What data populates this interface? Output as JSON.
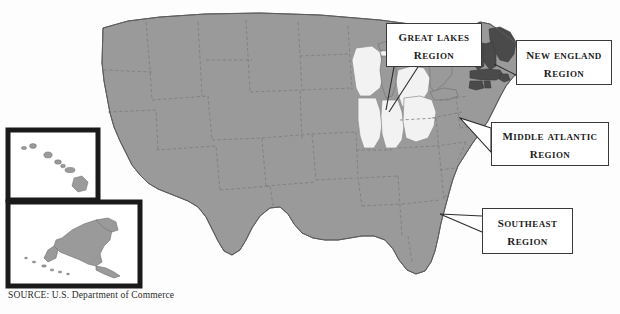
{
  "figure": {
    "source_note": "SOURCE: U.S. Department of Commerce",
    "base_map_name": "united-states-map"
  },
  "colors": {
    "base_state_fill": "#9a9a9a",
    "highlight_light_fill": "#f2f2f2",
    "highlight_dark_fill": "#4a4a4a",
    "state_border": "#6f6f6f",
    "outline": "#5c5c5c",
    "callout_border": "#3a3a3a",
    "callout_fill": "#ffffff",
    "text": "#1c1c1c",
    "inset_border": "#1a1a1a",
    "background": "#fdfdfd"
  },
  "callouts": [
    {
      "id": "great-lakes",
      "line1": "Great Lakes",
      "line2": "Region",
      "shading": "light",
      "states": [
        "Wisconsin",
        "Michigan",
        "Illinois",
        "Indiana",
        "Ohio"
      ]
    },
    {
      "id": "new-england",
      "line1": "New England",
      "line2": "Region",
      "shading": "dark",
      "states": [
        "Maine",
        "New Hampshire",
        "Vermont",
        "Massachusetts",
        "Rhode Island",
        "Connecticut"
      ]
    },
    {
      "id": "middle-atlantic",
      "line1": "Middle Atlantic",
      "line2": "Region",
      "shading": "base",
      "states": [
        "New York",
        "Pennsylvania",
        "New Jersey",
        "Delaware",
        "Maryland"
      ]
    },
    {
      "id": "southeast",
      "line1": "Southeast",
      "line2": "Region",
      "shading": "base",
      "states": [
        "Virginia",
        "North Carolina",
        "South Carolina",
        "Georgia",
        "Florida",
        "Alabama",
        "Mississippi",
        "Tennessee",
        "Kentucky"
      ]
    }
  ],
  "insets": [
    {
      "id": "hawaii",
      "name": "Hawaii"
    },
    {
      "id": "alaska",
      "name": "Alaska"
    }
  ]
}
